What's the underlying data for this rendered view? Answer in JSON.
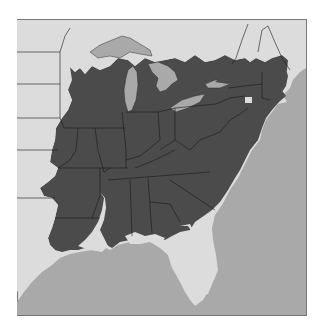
{
  "map": {
    "title": "",
    "region": "Eastern United States",
    "legend": [
      {
        "label": "Range",
        "color": "#4b4b4b"
      },
      {
        "label": "Land outside range",
        "color": "#dcdcdc"
      },
      {
        "label": "Water",
        "color": "#a9a9a9"
      }
    ],
    "colors": {
      "background": "#ffffff",
      "frame": "#777777",
      "land": "#dcdcdc",
      "range": "#4b4b4b",
      "water": "#a9a9a9",
      "borders": "#1a1a1a"
    }
  }
}
